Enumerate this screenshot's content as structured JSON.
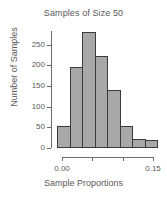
{
  "chart_data": {
    "type": "bar",
    "title": "Samples of Size 50",
    "xlabel": "Sample Proportions",
    "ylabel": "Number of Samples",
    "grid": false,
    "legend": false,
    "bin_edges": [
      0.0125,
      0.0333,
      0.0542,
      0.075,
      0.0958,
      0.1167,
      0.1375,
      0.1583,
      0.1792
    ],
    "categories": [
      "bin1",
      "bin2",
      "bin3",
      "bin4",
      "bin5",
      "bin6",
      "bin7",
      "bin8"
    ],
    "values": [
      53,
      195,
      280,
      222,
      141,
      53,
      22,
      20
    ],
    "ylim": [
      0,
      290
    ],
    "xlim": [
      0.0,
      0.18
    ],
    "yticks": [
      0,
      50,
      100,
      150,
      200,
      250
    ],
    "ytick_labels": [
      "0",
      "50",
      "100",
      "150",
      "200",
      "250"
    ],
    "xticks": [
      0.0,
      0.05,
      0.1,
      0.15
    ],
    "xtick_labels": [
      "0.00",
      "",
      "",
      "0.15"
    ],
    "bar_fill_color": "#a8a8a8",
    "bar_border_color": "#3b3b3b",
    "axis_color": "#6b6b6b",
    "text_color": "#5a5a5a"
  }
}
